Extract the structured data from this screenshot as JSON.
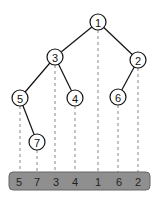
{
  "diagram": {
    "type": "binary-tree-inorder-projection",
    "nodes": [
      {
        "id": "n1",
        "label": "1",
        "x": 98,
        "y": 22
      },
      {
        "id": "n3",
        "label": "3",
        "x": 55,
        "y": 57
      },
      {
        "id": "n2",
        "label": "2",
        "x": 138,
        "y": 60
      },
      {
        "id": "n5",
        "label": "5",
        "x": 20,
        "y": 98
      },
      {
        "id": "n4",
        "label": "4",
        "x": 75,
        "y": 98
      },
      {
        "id": "n6",
        "label": "6",
        "x": 118,
        "y": 97
      },
      {
        "id": "n7",
        "label": "7",
        "x": 37,
        "y": 142
      }
    ],
    "edges": [
      {
        "from": "1",
        "to": "3"
      },
      {
        "from": "1",
        "to": "2"
      },
      {
        "from": "3",
        "to": "5"
      },
      {
        "from": "3",
        "to": "4"
      },
      {
        "from": "2",
        "to": "6"
      },
      {
        "from": "5",
        "to": "7"
      }
    ],
    "sequence": [
      "5",
      "7",
      "3",
      "4",
      "1",
      "6",
      "2"
    ]
  }
}
